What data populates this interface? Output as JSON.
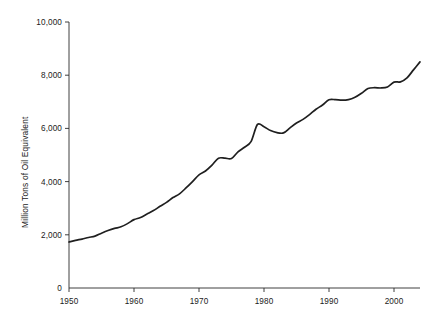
{
  "chart_data": {
    "type": "line",
    "title": "",
    "subtitle": "",
    "xlabel": "",
    "ylabel": "Million Tons of Oil Equivalent",
    "xlim": [
      1950,
      2004
    ],
    "ylim": [
      0,
      10000
    ],
    "grid": false,
    "legend": null,
    "legend_position": "none",
    "x_ticks": [
      1950,
      1960,
      1970,
      1980,
      1990,
      2000
    ],
    "x_tick_labels": [
      "1950",
      "1960",
      "1970",
      "1980",
      "1990",
      "2000"
    ],
    "y_ticks": [
      0,
      2000,
      4000,
      6000,
      8000,
      10000
    ],
    "y_tick_labels": [
      "0",
      "2,000",
      "4,000",
      "6,000",
      "8,000",
      "10,000"
    ],
    "series": [
      {
        "name": "World Primary Energy Consumption",
        "x": [
          1950,
          1951,
          1952,
          1953,
          1954,
          1955,
          1956,
          1957,
          1958,
          1959,
          1960,
          1961,
          1962,
          1963,
          1964,
          1965,
          1966,
          1967,
          1968,
          1969,
          1970,
          1971,
          1972,
          1973,
          1974,
          1975,
          1976,
          1977,
          1978,
          1979,
          1980,
          1981,
          1982,
          1983,
          1984,
          1985,
          1986,
          1987,
          1988,
          1989,
          1990,
          1991,
          1992,
          1993,
          1994,
          1995,
          1996,
          1997,
          1998,
          1999,
          2000,
          2001,
          2002,
          2003,
          2004
        ],
        "values": [
          1730,
          1790,
          1840,
          1900,
          1950,
          2060,
          2160,
          2240,
          2300,
          2420,
          2570,
          2650,
          2780,
          2910,
          3070,
          3220,
          3400,
          3540,
          3760,
          4000,
          4250,
          4400,
          4620,
          4880,
          4880,
          4870,
          5120,
          5290,
          5500,
          6150,
          6060,
          5920,
          5840,
          5830,
          6020,
          6200,
          6340,
          6520,
          6720,
          6880,
          7080,
          7080,
          7060,
          7080,
          7170,
          7320,
          7500,
          7530,
          7520,
          7560,
          7740,
          7750,
          7900,
          8200,
          8500
        ],
        "color": "#1f1f1f"
      }
    ]
  },
  "axes": {
    "y_axis_title": "Million Tons of Oil Equivalent"
  }
}
